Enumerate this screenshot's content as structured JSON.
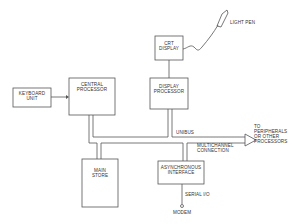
{
  "diagram": {
    "type": "block-diagram",
    "line_color": "#555555",
    "background": "#ffffff",
    "blocks": {
      "keyboard_unit": {
        "line1": "KEYBOARD",
        "line2": "UNIT"
      },
      "central_processor": {
        "line1": "CENTRAL",
        "line2": "PROCESSOR"
      },
      "crt_display": {
        "line1": "CRT",
        "line2": "DISPLAY"
      },
      "display_processor": {
        "line1": "DISPLAY",
        "line2": "PROCESSOR"
      },
      "main_store": {
        "line1": "MAIN",
        "line2": "STORE"
      },
      "async_interface": {
        "line1": "ASYNCHRONOUS",
        "line2": "INTERFACE"
      }
    },
    "labels": {
      "light_pen": "LIGHT PEN",
      "unibus": "UNIBUS",
      "multichannel_1": "MULTICHANNEL",
      "multichannel_2": "CONNECTION",
      "peripherals_1": "TO",
      "peripherals_2": "PERIPHERALS",
      "peripherals_3": "OR OTHER",
      "peripherals_4": "PROCESSORS",
      "serial_io": "SERIAL I/O",
      "modem": "MODEM"
    }
  }
}
